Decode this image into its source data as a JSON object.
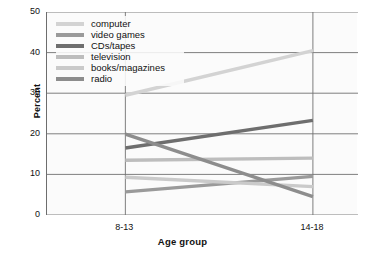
{
  "chart_data": {
    "type": "line",
    "title": "",
    "xlabel": "Age group",
    "ylabel": "Percent",
    "categories": [
      "8-13",
      "14-18"
    ],
    "x": [
      0,
      1
    ],
    "ylim": [
      0,
      50
    ],
    "yticks": [
      0,
      10,
      20,
      30,
      40,
      50
    ],
    "ytick_labels": [
      "0",
      "10",
      "20",
      "30",
      "40",
      "50"
    ],
    "grid": true,
    "grid_axis": "y",
    "legend_position": "upper-left",
    "series": [
      {
        "name": "computer",
        "values": [
          29.5,
          40.5
        ],
        "color": "#d3d3d3"
      },
      {
        "name": "video games",
        "values": [
          5.7,
          9.5
        ],
        "color": "#9a9a9a"
      },
      {
        "name": "CDs/tapes",
        "values": [
          16.5,
          23.3
        ],
        "color": "#6e6e6e"
      },
      {
        "name": "television",
        "values": [
          13.5,
          14.0
        ],
        "color": "#bdbdbd"
      },
      {
        "name": "books/magazines",
        "values": [
          9.3,
          7.0
        ],
        "color": "#cacaca"
      },
      {
        "name": "radio",
        "values": [
          19.9,
          4.5
        ],
        "color": "#8d8d8d"
      }
    ]
  },
  "legend": {
    "items": [
      {
        "label": "computer"
      },
      {
        "label": "video games"
      },
      {
        "label": "CDs/tapes"
      },
      {
        "label": "television"
      },
      {
        "label": "books/magazines"
      },
      {
        "label": "radio"
      }
    ]
  },
  "axes": {
    "y_title": "Percent",
    "x_title": "Age group",
    "y_ticks": [
      "50",
      "40",
      "30",
      "20",
      "10",
      "0"
    ],
    "x_ticks": [
      "8-13",
      "14-18"
    ]
  },
  "colors": {
    "axis": "#6d6d6d",
    "grid": "#707070",
    "plot_background": "#fbfbfb",
    "page_background": "#ffffff",
    "text": "#111111"
  }
}
